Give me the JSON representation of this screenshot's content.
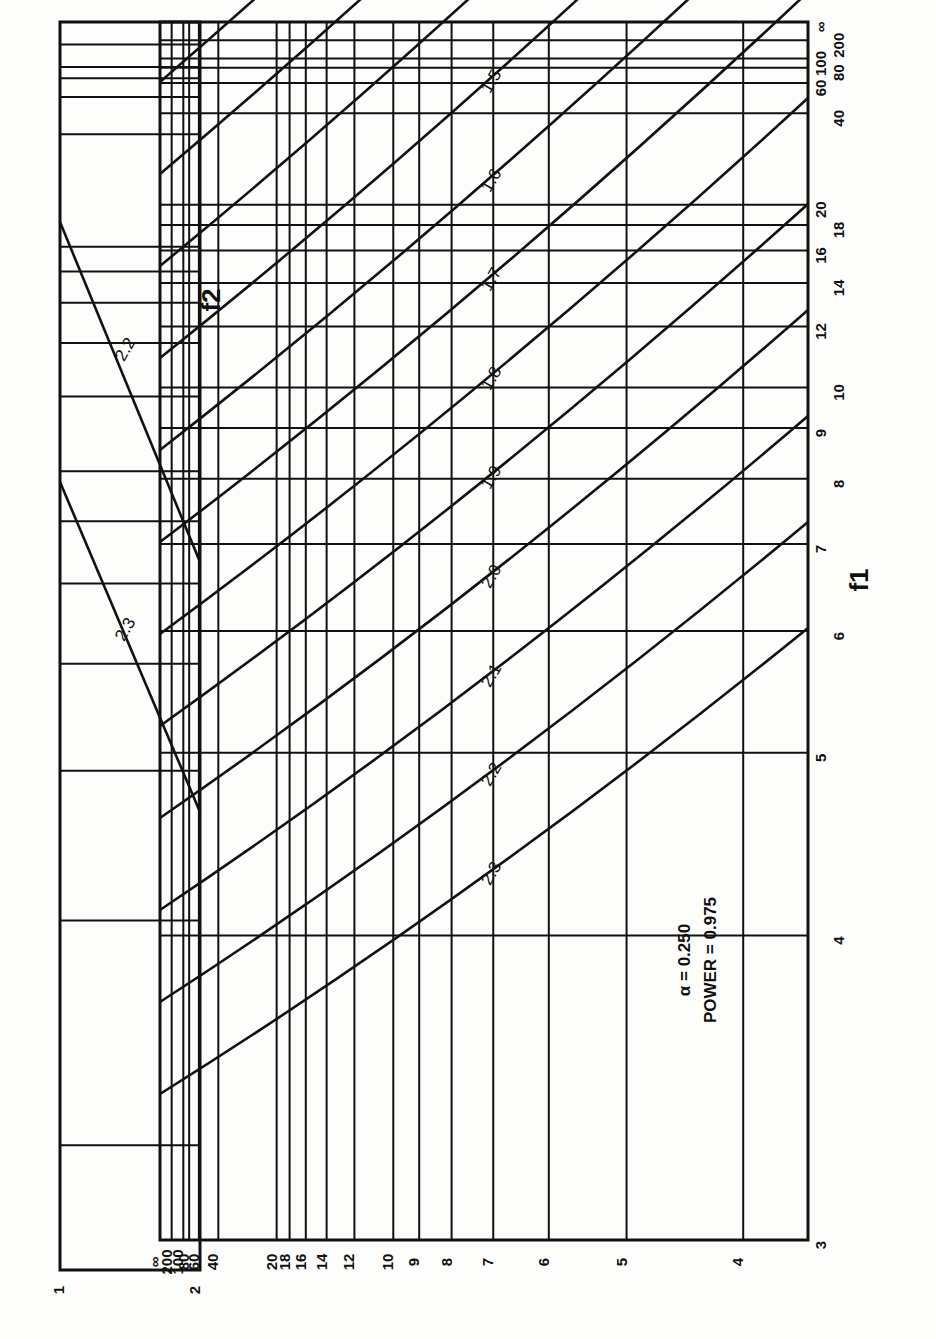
{
  "chart_data": {
    "type": "line",
    "legend_text": {
      "alpha": "α  = 0.250",
      "power": "POWER = 0.975"
    },
    "xlabel": "f1",
    "ylabel": "f2",
    "f1_ticks": [
      "3",
      "4",
      "5",
      "6",
      "7",
      "8",
      "9",
      "10",
      "12",
      "14",
      "16",
      "18",
      "20",
      "40",
      "60",
      "80",
      "100",
      "200",
      "∞"
    ],
    "f2_ticks": [
      "4",
      "5",
      "6",
      "7",
      "8",
      "9",
      "10",
      "12",
      "14",
      "16",
      "18",
      "20",
      "40",
      "60",
      "80",
      "100",
      "200",
      "∞"
    ],
    "inset": {
      "f1_range": [
        1,
        2
      ],
      "f1_ticks": [
        "1",
        "2"
      ],
      "curves": [
        {
          "phi": "2.2"
        },
        {
          "phi": "2.3"
        }
      ]
    },
    "phi_label_prefix": "φ =",
    "series": [
      {
        "name": "1.2"
      },
      {
        "name": "1.3"
      },
      {
        "name": "1.4"
      },
      {
        "name": "1.5"
      },
      {
        "name": "1.6"
      },
      {
        "name": "1.7"
      },
      {
        "name": "1.8"
      },
      {
        "name": "1.9"
      },
      {
        "name": "2.0"
      },
      {
        "name": "2.1"
      },
      {
        "name": "2.2"
      },
      {
        "name": "2.3"
      }
    ],
    "grid": true
  }
}
